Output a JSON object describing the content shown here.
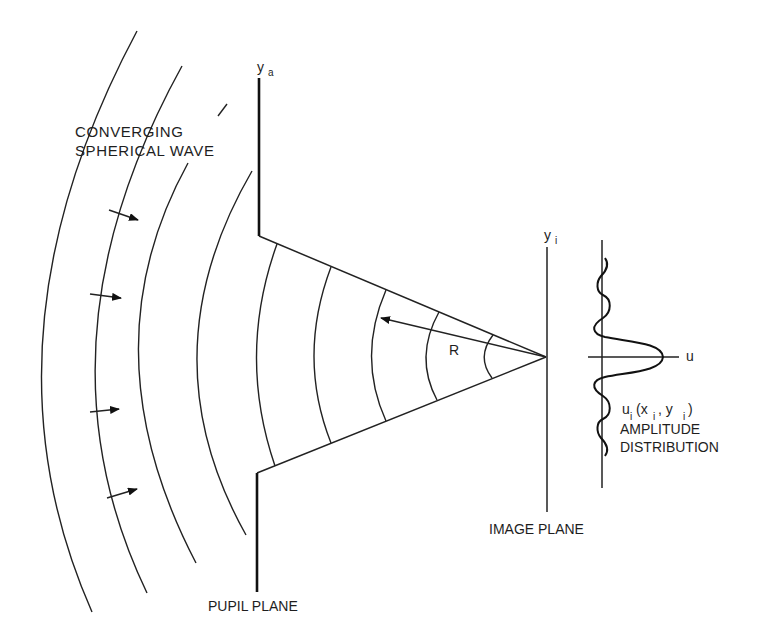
{
  "diagram": {
    "type": "optics-schematic",
    "labels": {
      "wave_line1": "CONVERGING",
      "wave_line2": "SPHERICAL WAVE",
      "pupil_axis": "y",
      "pupil_axis_sub": "a",
      "image_axis": "y",
      "image_axis_sub": "i",
      "radius": "R",
      "amp_axis": "u",
      "amp_func_u": "u",
      "amp_func_u_sub": "i",
      "amp_func_open": "(x",
      "amp_func_x_sub": "i",
      "amp_func_sep": " , y",
      "amp_func_y_sub": "i",
      "amp_func_close": ")",
      "amp_line1": "AMPLITUDE",
      "amp_line2": "DISTRIBUTION",
      "pupil_plane": "PUPIL PLANE",
      "image_plane": "IMAGE PLANE"
    },
    "outer_wavefront_count": 5,
    "inner_wavefront_count": 5,
    "direction_arrow_count": 4,
    "stroke_color": "#222222"
  }
}
